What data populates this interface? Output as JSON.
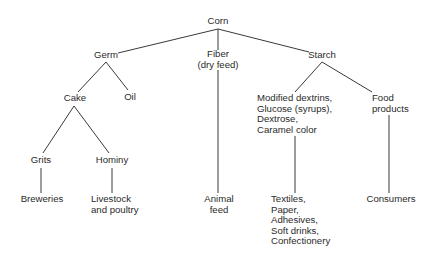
{
  "diagram": {
    "title": "Corn",
    "nodes": {
      "corn": {
        "lines": [
          "Corn"
        ]
      },
      "germ": {
        "lines": [
          "Germ"
        ]
      },
      "fiber": {
        "lines": [
          "Fiber",
          "(dry feed)"
        ]
      },
      "starch": {
        "lines": [
          "Starch"
        ]
      },
      "cake": {
        "lines": [
          "Cake"
        ]
      },
      "oil": {
        "lines": [
          "Oil"
        ]
      },
      "grits": {
        "lines": [
          "Grits"
        ]
      },
      "hominy": {
        "lines": [
          "Hominy"
        ]
      },
      "breweries": {
        "lines": [
          "Breweries"
        ]
      },
      "livestock": {
        "lines": [
          "Livestock",
          "and poultry"
        ]
      },
      "animal_feed": {
        "lines": [
          "Animal",
          "feed"
        ]
      },
      "starch_products": {
        "lines": [
          "Modified dextrins,",
          "Glucose (syrups),",
          "Dextrose,",
          "Caramel color"
        ]
      },
      "food_products": {
        "lines": [
          "Food",
          "products"
        ]
      },
      "industrial_uses": {
        "lines": [
          "Textiles,",
          "Paper,",
          "Adhesives,",
          "Soft drinks,",
          "Confectionery"
        ]
      },
      "consumers": {
        "lines": [
          "Consumers"
        ]
      }
    },
    "edges": [
      [
        "corn",
        "germ"
      ],
      [
        "corn",
        "fiber"
      ],
      [
        "corn",
        "starch"
      ],
      [
        "germ",
        "cake"
      ],
      [
        "germ",
        "oil"
      ],
      [
        "cake",
        "grits"
      ],
      [
        "cake",
        "hominy"
      ],
      [
        "grits",
        "breweries"
      ],
      [
        "hominy",
        "livestock"
      ],
      [
        "fiber",
        "animal_feed"
      ],
      [
        "starch",
        "starch_products"
      ],
      [
        "starch",
        "food_products"
      ],
      [
        "starch_products",
        "industrial_uses"
      ],
      [
        "food_products",
        "consumers"
      ]
    ],
    "line_color": "#3a3a3a"
  }
}
